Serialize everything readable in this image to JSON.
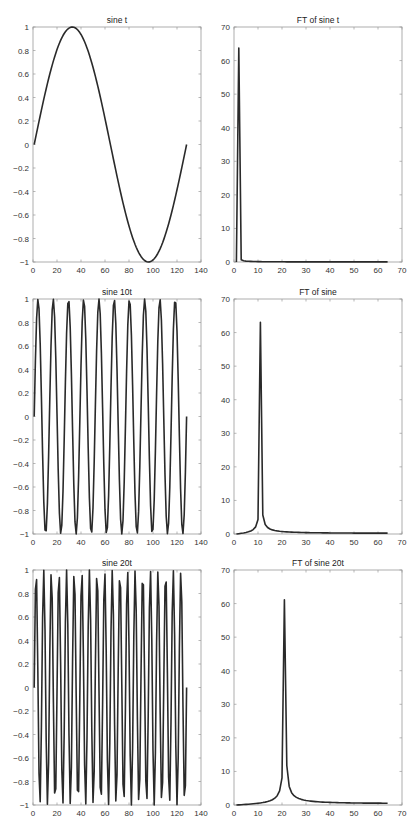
{
  "chart_data": [
    {
      "type": "line",
      "title": "sine t",
      "xlabel": "",
      "ylabel": "",
      "xlim": [
        0,
        140
      ],
      "ylim": [
        -1,
        1
      ],
      "xticks": [
        0,
        20,
        40,
        60,
        80,
        100,
        120,
        140
      ],
      "yticks": [
        -1,
        -0.8,
        -0.6,
        -0.4,
        -0.2,
        0,
        0.2,
        0.4,
        0.6,
        0.8,
        1
      ],
      "grid": false,
      "series": [
        {
          "name": "sin(t)",
          "function": "sin",
          "cycles": 1,
          "n_points": 128,
          "x_range": [
            1,
            128
          ],
          "amplitude": 1
        }
      ]
    },
    {
      "type": "line",
      "title": "FT of sine t",
      "xlabel": "",
      "ylabel": "",
      "xlim": [
        0,
        70
      ],
      "ylim": [
        0,
        70
      ],
      "xticks": [
        0,
        10,
        20,
        30,
        40,
        50,
        60,
        70
      ],
      "yticks": [
        0,
        10,
        20,
        30,
        40,
        50,
        60,
        70
      ],
      "grid": false,
      "series": [
        {
          "name": "|FFT|",
          "function": "fft_magnitude",
          "cycles": 1,
          "n_points": 64,
          "x_range": [
            1,
            64
          ],
          "peak_x": 1.5,
          "peak_y": 64
        }
      ]
    },
    {
      "type": "line",
      "title": "sine 10t",
      "xlabel": "",
      "ylabel": "",
      "xlim": [
        0,
        140
      ],
      "ylim": [
        -1,
        1
      ],
      "xticks": [
        0,
        20,
        40,
        60,
        80,
        100,
        120,
        140
      ],
      "yticks": [
        -1,
        -0.8,
        -0.6,
        -0.4,
        -0.2,
        0,
        0.2,
        0.4,
        0.6,
        0.8,
        1
      ],
      "grid": false,
      "series": [
        {
          "name": "sin(10t)",
          "function": "sin",
          "cycles": 10,
          "n_points": 128,
          "x_range": [
            1,
            128
          ],
          "amplitude": 1
        }
      ]
    },
    {
      "type": "line",
      "title": "FT of sine",
      "xlabel": "",
      "ylabel": "",
      "xlim": [
        0,
        70
      ],
      "ylim": [
        0,
        70
      ],
      "xticks": [
        0,
        10,
        20,
        30,
        40,
        50,
        60,
        70
      ],
      "yticks": [
        0,
        10,
        20,
        30,
        40,
        50,
        60,
        70
      ],
      "grid": false,
      "series": [
        {
          "name": "|FFT|",
          "function": "fft_magnitude",
          "cycles": 10,
          "n_points": 64,
          "x_range": [
            1,
            64
          ],
          "peak_x": 11,
          "peak_y": 63.5
        }
      ]
    },
    {
      "type": "line",
      "title": "sine 20t",
      "xlabel": "",
      "ylabel": "",
      "xlim": [
        0,
        140
      ],
      "ylim": [
        -1,
        1
      ],
      "xticks": [
        0,
        20,
        40,
        60,
        80,
        100,
        120,
        140
      ],
      "yticks": [
        -1,
        -0.8,
        -0.6,
        -0.4,
        -0.2,
        0,
        0.2,
        0.4,
        0.6,
        0.8,
        1
      ],
      "grid": false,
      "series": [
        {
          "name": "sin(20t)",
          "function": "sin",
          "cycles": 20,
          "n_points": 128,
          "x_range": [
            1,
            128
          ],
          "amplitude": 1
        }
      ]
    },
    {
      "type": "line",
      "title": "FT of sine 20t",
      "xlabel": "",
      "ylabel": "",
      "xlim": [
        0,
        70
      ],
      "ylim": [
        0,
        70
      ],
      "xticks": [
        0,
        10,
        20,
        30,
        40,
        50,
        60,
        70
      ],
      "yticks": [
        0,
        10,
        20,
        30,
        40,
        50,
        60,
        70
      ],
      "grid": false,
      "series": [
        {
          "name": "|FFT|",
          "function": "fft_magnitude",
          "cycles": 20,
          "n_points": 64,
          "x_range": [
            1,
            64
          ],
          "peak_x": 21,
          "peak_y": 61.5
        }
      ]
    }
  ],
  "layout": {
    "panels": [
      {
        "left": 33,
        "top": 27,
        "width": 168,
        "height": 235
      },
      {
        "left": 234,
        "top": 27,
        "width": 168,
        "height": 235
      },
      {
        "left": 33,
        "top": 299,
        "width": 168,
        "height": 235
      },
      {
        "left": 234,
        "top": 299,
        "width": 168,
        "height": 235
      },
      {
        "left": 33,
        "top": 570,
        "width": 168,
        "height": 235
      },
      {
        "left": 234,
        "top": 570,
        "width": 168,
        "height": 235
      }
    ],
    "line_color": "#2a2a2a",
    "axes_color": "#9a9a9a",
    "text_color": "#333333"
  }
}
